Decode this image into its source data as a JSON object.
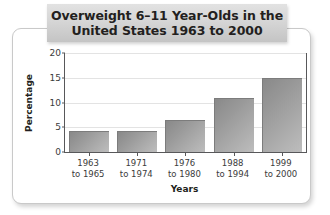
{
  "title": {
    "line1": "Overweight 6–11 Year-Olds in the",
    "line2": "United States 1963 to 2000"
  },
  "chart_data": {
    "type": "bar",
    "xlabel": "Years",
    "ylabel": "Percentage",
    "categories": [
      "1963 to 1965",
      "1971 to 1974",
      "1976 to 1980",
      "1988 to 1994",
      "1999 to 2000"
    ],
    "category_lines": [
      [
        "1963",
        "to 1965"
      ],
      [
        "1971",
        "to 1974"
      ],
      [
        "1976",
        "to 1980"
      ],
      [
        "1988",
        "to 1994"
      ],
      [
        "1999",
        "to 2000"
      ]
    ],
    "values": [
      4.2,
      4.2,
      6.5,
      11.0,
      15.0
    ],
    "ylim": [
      0,
      20
    ],
    "yticks": [
      0,
      5,
      10,
      15,
      20
    ],
    "ytick_labels": [
      "0",
      "5",
      "10",
      "15",
      "20"
    ],
    "grid": true,
    "legend": "none",
    "bar_color": "#9a9a9a",
    "axis_color": "#58585a",
    "grid_color": "#e3e3e3",
    "title_banner_color": "#d6d6d6"
  }
}
